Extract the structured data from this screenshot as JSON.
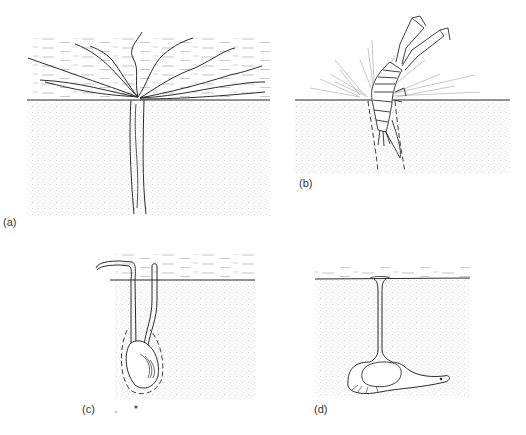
{
  "figure": {
    "colors": {
      "ink": "#2b2b2b",
      "sediment_stipple": "#b8b8b8",
      "water_dash": "#9a9a9a",
      "background": "#ffffff"
    },
    "panels": [
      {
        "id": "a",
        "label": "(a)",
        "subject": "tube-dwelling worm with tentacles spread over sediment surface"
      },
      {
        "id": "b",
        "label": "(b)",
        "subject": "burrowing shrimp-like crustacean emerging from sediment"
      },
      {
        "id": "c",
        "label": "(c)",
        "subject": "buried bivalve with siphons extending to the surface"
      },
      {
        "id": "d",
        "label": "(d)",
        "subject": "organism in chamber with vertical shaft to surface"
      }
    ]
  }
}
